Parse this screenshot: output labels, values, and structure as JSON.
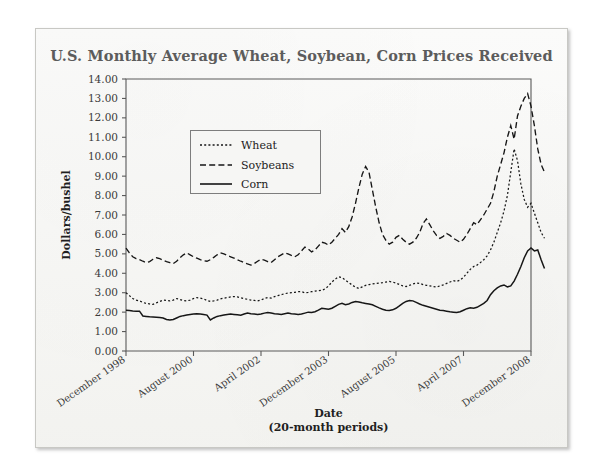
{
  "chart_data": {
    "type": "line",
    "title": "U.S. Monthly Average Wheat, Soybean, Corn Prices Received",
    "xlabel": "Date",
    "xlabel_sub": "(20-month periods)",
    "ylabel": "Dollars/bushel",
    "ylim": [
      0.0,
      14.0
    ],
    "ytick_step": 1.0,
    "ytick_labels": [
      "14.00",
      "13.00",
      "12.00",
      "11.00",
      "10.00",
      "9.00",
      "8.00",
      "7.00",
      "6.00",
      "5.00",
      "4.00",
      "3.00",
      "2.00",
      "1.00",
      "0.00"
    ],
    "xtick_labels": [
      "December 1998",
      "August 2000",
      "April 2002",
      "December 2003",
      "August 2005",
      "April 2007",
      "December 2008"
    ],
    "xtick_index": [
      0,
      20,
      40,
      60,
      80,
      100,
      120
    ],
    "grid": false,
    "legend_position": "upper-left-inset",
    "x_count": 121,
    "series": [
      {
        "name": "Wheat",
        "style": "dotted",
        "color": "#161616",
        "values": [
          3.0,
          2.85,
          2.7,
          2.62,
          2.58,
          2.5,
          2.45,
          2.42,
          2.4,
          2.48,
          2.55,
          2.62,
          2.6,
          2.58,
          2.62,
          2.7,
          2.65,
          2.6,
          2.58,
          2.62,
          2.7,
          2.75,
          2.72,
          2.68,
          2.6,
          2.55,
          2.58,
          2.62,
          2.68,
          2.72,
          2.75,
          2.78,
          2.8,
          2.78,
          2.74,
          2.7,
          2.66,
          2.62,
          2.6,
          2.58,
          2.62,
          2.7,
          2.75,
          2.72,
          2.8,
          2.85,
          2.9,
          2.95,
          2.98,
          3.0,
          3.02,
          3.05,
          3.05,
          3.0,
          3.02,
          3.05,
          3.08,
          3.1,
          3.12,
          3.2,
          3.35,
          3.55,
          3.7,
          3.82,
          3.78,
          3.65,
          3.52,
          3.4,
          3.28,
          3.22,
          3.3,
          3.38,
          3.42,
          3.45,
          3.48,
          3.5,
          3.52,
          3.55,
          3.58,
          3.55,
          3.5,
          3.42,
          3.35,
          3.32,
          3.38,
          3.45,
          3.5,
          3.48,
          3.42,
          3.38,
          3.35,
          3.32,
          3.3,
          3.35,
          3.4,
          3.48,
          3.55,
          3.62,
          3.58,
          3.65,
          3.8,
          4.0,
          4.2,
          4.35,
          4.42,
          4.55,
          4.7,
          4.9,
          5.2,
          5.6,
          6.1,
          6.6,
          7.2,
          8.0,
          9.2,
          10.4,
          9.8,
          8.6,
          7.8,
          7.4,
          7.6,
          7.1,
          6.6,
          6.1,
          5.8
        ]
      },
      {
        "name": "Soybeans",
        "style": "dashed",
        "color": "#161616",
        "values": [
          5.3,
          5.05,
          4.85,
          4.75,
          4.7,
          4.62,
          4.55,
          4.6,
          4.72,
          4.8,
          4.75,
          4.68,
          4.6,
          4.55,
          4.5,
          4.62,
          4.8,
          4.95,
          5.05,
          4.95,
          4.85,
          4.78,
          4.7,
          4.65,
          4.62,
          4.7,
          4.82,
          4.95,
          5.05,
          5.0,
          4.92,
          4.85,
          4.78,
          4.7,
          4.62,
          4.55,
          4.48,
          4.42,
          4.5,
          4.62,
          4.72,
          4.68,
          4.6,
          4.55,
          4.7,
          4.85,
          4.95,
          5.05,
          5.0,
          4.92,
          4.85,
          4.95,
          5.15,
          5.35,
          5.25,
          5.1,
          5.2,
          5.4,
          5.6,
          5.55,
          5.45,
          5.6,
          5.8,
          6.0,
          6.3,
          6.1,
          6.4,
          6.9,
          7.6,
          8.4,
          9.1,
          9.5,
          9.2,
          8.3,
          7.4,
          6.6,
          6.0,
          5.7,
          5.5,
          5.6,
          5.85,
          5.95,
          5.75,
          5.6,
          5.5,
          5.6,
          5.8,
          6.1,
          6.55,
          6.8,
          6.5,
          6.2,
          5.95,
          5.8,
          5.9,
          6.05,
          5.95,
          5.8,
          5.7,
          5.6,
          5.75,
          6.0,
          6.3,
          6.6,
          6.5,
          6.75,
          7.0,
          7.3,
          7.6,
          8.2,
          9.0,
          9.6,
          10.2,
          11.0,
          11.6,
          10.9,
          12.1,
          12.6,
          13.0,
          13.25,
          12.6,
          11.6,
          10.4,
          9.6,
          9.2
        ]
      },
      {
        "name": "Corn",
        "style": "solid",
        "color": "#161616",
        "values": [
          2.1,
          2.08,
          2.06,
          2.05,
          2.05,
          1.8,
          1.78,
          1.76,
          1.75,
          1.74,
          1.72,
          1.7,
          1.62,
          1.6,
          1.62,
          1.7,
          1.78,
          1.82,
          1.85,
          1.88,
          1.9,
          1.92,
          1.9,
          1.88,
          1.85,
          1.6,
          1.7,
          1.78,
          1.82,
          1.85,
          1.88,
          1.9,
          1.88,
          1.86,
          1.84,
          1.9,
          1.95,
          1.92,
          1.9,
          1.88,
          1.9,
          1.95,
          1.98,
          1.95,
          1.92,
          1.9,
          1.88,
          1.92,
          1.95,
          1.92,
          1.9,
          1.88,
          1.9,
          1.95,
          2.0,
          1.98,
          2.02,
          2.1,
          2.2,
          2.18,
          2.15,
          2.2,
          2.3,
          2.4,
          2.45,
          2.38,
          2.42,
          2.5,
          2.55,
          2.52,
          2.48,
          2.45,
          2.42,
          2.38,
          2.3,
          2.22,
          2.15,
          2.1,
          2.08,
          2.12,
          2.2,
          2.32,
          2.45,
          2.55,
          2.6,
          2.58,
          2.5,
          2.42,
          2.35,
          2.3,
          2.25,
          2.2,
          2.15,
          2.1,
          2.08,
          2.05,
          2.02,
          2.0,
          1.98,
          2.02,
          2.1,
          2.18,
          2.22,
          2.2,
          2.25,
          2.35,
          2.45,
          2.6,
          2.9,
          3.1,
          3.25,
          3.35,
          3.4,
          3.3,
          3.35,
          3.6,
          3.95,
          4.35,
          4.8,
          5.15,
          5.3,
          5.15,
          5.2,
          4.7,
          4.25
        ]
      }
    ]
  }
}
